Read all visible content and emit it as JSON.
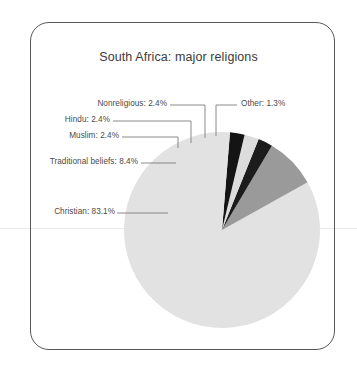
{
  "figure": {
    "title": "South Africa: major religions",
    "frame": {
      "style": "rounded-rectangle-border",
      "color": "#585858"
    }
  },
  "chart_data": {
    "type": "pie",
    "title": "South Africa: major religions",
    "xlabel": "",
    "ylabel": "",
    "legend_position": "none",
    "labels_position": "callout-leader-lines",
    "start_angle_deg": 90,
    "direction": "counterclockwise",
    "categories": [
      "Christian",
      "Traditional beliefs",
      "Muslim",
      "Hindu",
      "Nonreligious",
      "Other"
    ],
    "values": [
      83.1,
      8.4,
      2.4,
      2.4,
      2.4,
      1.3
    ],
    "units": "percent",
    "slices": [
      {
        "name": "Christian",
        "value": 83.1,
        "label": "Christian: 83.1%",
        "color": "#e2e2e2"
      },
      {
        "name": "Traditional beliefs",
        "value": 8.4,
        "label": "Traditional beliefs: 8.4%",
        "color": "#9a9a9a"
      },
      {
        "name": "Muslim",
        "value": 2.4,
        "label": "Muslim: 2.4%",
        "color": "#1c1c1c"
      },
      {
        "name": "Hindu",
        "value": 2.4,
        "label": "Hindu: 2.4%",
        "color": "#dcdcdc"
      },
      {
        "name": "Nonreligious",
        "value": 2.4,
        "label": "Nonreligious: 2.4%",
        "color": "#141414"
      },
      {
        "name": "Other",
        "value": 1.3,
        "label": "Other: 1.3%",
        "color": "#e2e2e2"
      }
    ]
  },
  "colors": {
    "frame_border": "#585858",
    "title_text": "#3b3b3b",
    "label_text": "#4a4a4a",
    "leader_line": "#7d7d7d",
    "page_rule": "#e9e9e9",
    "background": "#ffffff"
  }
}
